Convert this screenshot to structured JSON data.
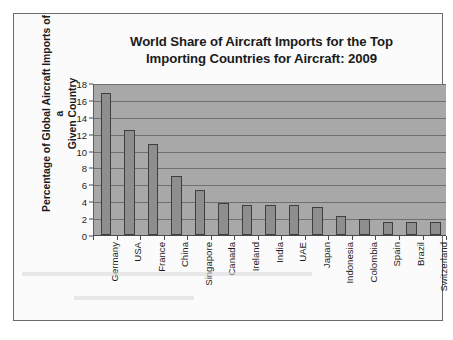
{
  "chart_data": {
    "type": "bar",
    "title": "World Share of Aircraft Imports for the Top Importing Countries for Aircraft: 2009",
    "title_lines": [
      "World Share of Aircraft Imports for the Top",
      "Importing Countries for Aircraft: 2009"
    ],
    "xlabel": "",
    "ylabel": "Percentage of Global Aircraft Imports of a Given Country",
    "ylabel_lines": [
      "Percentage of Global Aircraft Imports of a",
      "Given Country"
    ],
    "categories": [
      "Germany",
      "USA",
      "France",
      "China",
      "Singapore",
      "Canada",
      "Ireland",
      "India",
      "UAE",
      "Japan",
      "Indonesia",
      "Colombia",
      "Spain",
      "Brazil",
      "Switzerland"
    ],
    "values": [
      16.8,
      12.4,
      10.8,
      7.0,
      5.3,
      3.8,
      3.5,
      3.5,
      3.5,
      3.3,
      2.3,
      1.9,
      1.6,
      1.6,
      1.55
    ],
    "ylim": [
      0,
      18
    ],
    "ytick_values": [
      18,
      16,
      14,
      12,
      10,
      8,
      6,
      4,
      2,
      0
    ],
    "ytick_labels": [
      "18",
      "16",
      "14",
      "12",
      "10",
      "8",
      "6",
      "4",
      "2",
      "0"
    ],
    "grid": true,
    "legend": false,
    "legend_position": "none",
    "colors": {
      "bar_fill": "#8e8e8e",
      "bar_border": "#3f3f3f",
      "plot_background": "#a8a8a8",
      "gridline": "#6f6f6f",
      "axis": "#4a4a4a",
      "text": "#1b1b1b",
      "page_background": "#fbfbfb",
      "page_border": "#6a6a6a"
    }
  }
}
